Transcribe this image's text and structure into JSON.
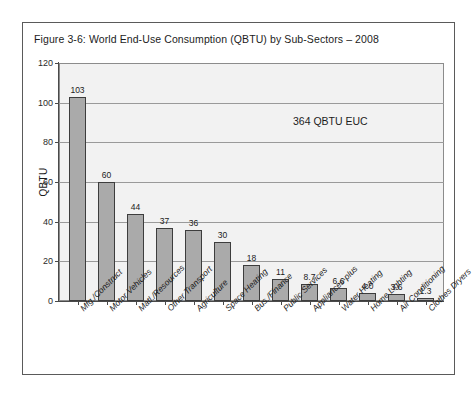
{
  "figure": {
    "caption": "Figure 3-6:  World End-Use Consumption (QBTU) by Sub-Sectors – 2008",
    "annotation": "364 QBTU EUC"
  },
  "chart_data": {
    "type": "bar",
    "title": "Figure 3-6:  World End-Use Consumption (QBTU) by Sub-Sectors – 2008",
    "xlabel": "",
    "ylabel": "QBTU",
    "ylim": [
      0,
      120
    ],
    "yticks": [
      "0",
      "20",
      "40",
      "60",
      "80",
      "100",
      "120"
    ],
    "grid": true,
    "legend": "none",
    "annotations": [
      "364 QBTU EUC"
    ],
    "categories": [
      "Mfg./Construct",
      "Motor Vehicles",
      "Matl./Resources",
      "Other Transport",
      "Agriculture",
      "Space Heating",
      "Bus./Finance",
      "Public Services",
      "Appliances-plus",
      "Water Heating",
      "Home Lighting",
      "Air Conditioning",
      "Clothes Dryers"
    ],
    "values": [
      103,
      60,
      44,
      37,
      36,
      30,
      18,
      11,
      8.7,
      6.6,
      4.0,
      3.6,
      1.3
    ],
    "value_labels": [
      "103",
      "60",
      "44",
      "37",
      "36",
      "30",
      "18",
      "11",
      "8.7",
      "6.6",
      "4.0",
      "3.6",
      "1.3"
    ],
    "bar_color": "#aaaaaa",
    "bar_edge_color": "#3d3d3d",
    "plot_background": "#f2f2f2"
  }
}
